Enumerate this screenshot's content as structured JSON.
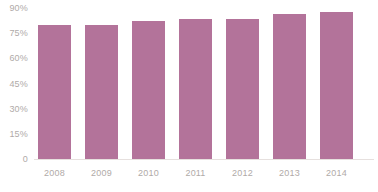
{
  "chart_data": {
    "type": "bar",
    "title": "",
    "subtitle": "",
    "xlabel": "",
    "ylabel": "",
    "categories": [
      "2008",
      "2009",
      "2010",
      "2011",
      "2012",
      "2013",
      "2014"
    ],
    "values": [
      76,
      76,
      78,
      79,
      79,
      82,
      83
    ],
    "series": [
      {
        "name": "",
        "values": [
          76,
          76,
          78,
          79,
          79,
          82,
          83
        ],
        "color": "#b3739a"
      }
    ],
    "ylim": [
      0,
      90
    ],
    "y_ticks": [
      0,
      15,
      30,
      45,
      60,
      75,
      90
    ],
    "y_tick_labels": [
      "0",
      "15%",
      "30%",
      "45%",
      "60%",
      "75%",
      "90%"
    ],
    "x_tick_labels": [
      "2008",
      "2009",
      "2010",
      "2011",
      "2012",
      "2013",
      "2014"
    ],
    "grid": false,
    "legend": null,
    "legend_position": "none",
    "annotations": [],
    "bar_color": "#b3739a",
    "axis_text_color": "#b0aaa8",
    "baseline_color": "#e6e0de",
    "background_color": "#ffffff"
  }
}
